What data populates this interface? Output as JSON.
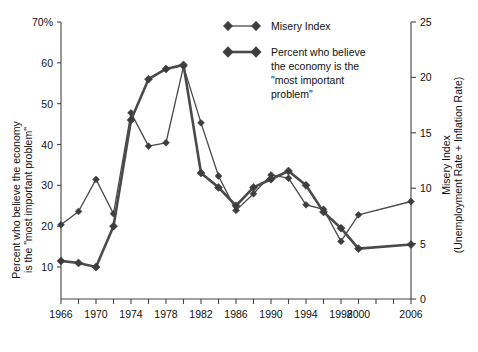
{
  "chart_data": {
    "type": "line",
    "title": "",
    "xlabel": "",
    "x": [
      1966,
      1968,
      1970,
      1972,
      1974,
      1976,
      1978,
      1980,
      1982,
      1984,
      1986,
      1988,
      1990,
      1992,
      1994,
      1996,
      1998,
      2000,
      2006
    ],
    "tick_years": [
      1966,
      1970,
      1974,
      1978,
      1982,
      1986,
      1990,
      1994,
      1998,
      2000,
      2006
    ],
    "tick_labels": [
      "1966",
      "1970",
      "1974",
      "1978",
      "1982",
      "1986",
      "1990",
      "1994",
      "1998",
      "2000",
      "2006"
    ],
    "left_axis": {
      "label_line1": "Percent who believe the economy",
      "label_line2": "is the \"most important problem\"",
      "ticks": [
        10,
        20,
        30,
        40,
        50,
        60,
        70
      ],
      "tick_labels": [
        "10",
        "20",
        "30",
        "40",
        "50",
        "60",
        "70%"
      ],
      "ylim": [
        5,
        70
      ]
    },
    "right_axis": {
      "label_line1": "Misery Index",
      "label_line2": "(Unemployment Rate + Inflation Rate)",
      "ticks": [
        0,
        5,
        10,
        15,
        20,
        25
      ],
      "tick_labels": [
        "0",
        "5",
        "10",
        "15",
        "20",
        "25"
      ],
      "ylim": [
        0,
        25
      ]
    },
    "grid": false,
    "legend_position": "top-right",
    "series": [
      {
        "name": "Misery Index",
        "axis": "right",
        "line_style": "thin",
        "marker": "diamond",
        "values": [
          6.7,
          7.9,
          10.8,
          7.7,
          16.8,
          13.8,
          14.1,
          21.0,
          15.9,
          11.1,
          8.0,
          9.5,
          11.2,
          10.9,
          8.5,
          8.1,
          5.2,
          7.6,
          8.8
        ]
      },
      {
        "name": "Percent who believe the economy is the \"most important problem\"",
        "axis": "left",
        "line_style": "thick",
        "marker": "diamond",
        "values": [
          11.5,
          11.0,
          10.0,
          20.0,
          46.0,
          56.0,
          58.5,
          59.5,
          33.0,
          29.5,
          25.0,
          29.5,
          31.5,
          33.5,
          30.0,
          23.5,
          19.5,
          14.5,
          15.5
        ]
      }
    ]
  },
  "legend": {
    "entries": [
      {
        "label": "Misery Index",
        "style": "thin"
      },
      {
        "label": "Percent who believe\nthe economy is the\n\"most important\nproblem\"",
        "style": "thick"
      }
    ],
    "entry1_label": "Misery Index",
    "entry2_line1": "Percent who believe",
    "entry2_line2": "the economy is the",
    "entry2_line3": "\"most important",
    "entry2_line4": "problem\""
  },
  "colors": {
    "line": "#4a4a4a",
    "axis": "#444444",
    "text": "#111111",
    "background": "#ffffff"
  }
}
